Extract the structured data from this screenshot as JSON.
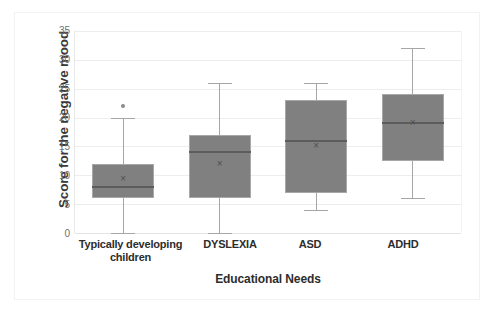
{
  "chart_data": {
    "type": "box",
    "title": "",
    "xlabel": "Educational  Needs",
    "ylabel": "Score for the negative mood",
    "ylim": [
      0,
      35
    ],
    "ytick_labels": [
      "35",
      "30",
      "25",
      "20",
      "15",
      "10",
      "5",
      "0"
    ],
    "ytick_values": [
      35,
      30,
      25,
      20,
      15,
      10,
      5,
      0
    ],
    "grid": true,
    "legend": "none",
    "categories": [
      "Typically developing children",
      "DYSLEXIA",
      "ASD",
      "ADHD"
    ],
    "boxes": [
      {
        "category": "Typically developing children",
        "label_line1": "Typically developing",
        "label_line2": "children",
        "min": 0,
        "q1": 6,
        "median": 8,
        "q3": 12,
        "max": 20,
        "mean": 9.3,
        "outliers": [
          22
        ]
      },
      {
        "category": "DYSLEXIA",
        "label_line1": "DYSLEXIA",
        "label_line2": "",
        "min": 0,
        "q1": 6,
        "median": 14,
        "q3": 17,
        "max": 26,
        "mean": 12,
        "outliers": []
      },
      {
        "category": "ASD",
        "label_line1": "ASD",
        "label_line2": "",
        "min": 4,
        "q1": 7,
        "median": 16,
        "q3": 23,
        "max": 26,
        "mean": 15,
        "outliers": []
      },
      {
        "category": "ADHD",
        "label_line1": "ADHD",
        "label_line2": "",
        "min": 6,
        "q1": 12.5,
        "median": 19,
        "q3": 24,
        "max": 32,
        "mean": 19,
        "outliers": []
      }
    ],
    "mean_marker_glyph": "×",
    "colors": {
      "box_fill": "#808080",
      "box_border": "#a8a8a8",
      "whisker": "#a6a6a6",
      "median": "#5c5c5c",
      "gridline": "#ededed",
      "tick_text": "#6f6f6f",
      "label_text": "#2d2d2d",
      "background": "#ffffff"
    }
  }
}
